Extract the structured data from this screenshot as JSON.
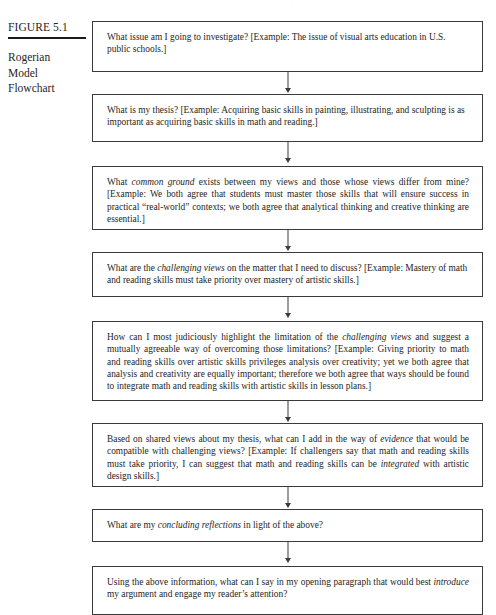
{
  "page": {
    "header_artifact": "· ·"
  },
  "caption": {
    "figure_number": "FIGURE 5.1",
    "title_lines": [
      "Rogerian",
      "Model",
      "Flowchart"
    ]
  },
  "flowchart": {
    "boxes": [
      {
        "id": "box-1",
        "name": "issue-question",
        "align": "left",
        "segments": [
          {
            "text": "What issue am I going to investigate? [Example: The issue of visual arts education in U.S. public schools.]",
            "italic": false
          }
        ]
      },
      {
        "id": "box-2",
        "name": "thesis-question",
        "align": "left",
        "segments": [
          {
            "text": "What is my thesis? [Example: Acquiring basic skills in painting, illustrating, and sculpting is as important as acquiring basic skills in math and reading.]",
            "italic": false
          }
        ]
      },
      {
        "id": "box-3",
        "name": "common-ground-question",
        "align": "justify",
        "segments": [
          {
            "text": "What ",
            "italic": false
          },
          {
            "text": "common ground",
            "italic": true
          },
          {
            "text": " exists between my views and those whose views differ from mine? [Example: We both agree that students must master those skills that will ensure success in practical “real-world” contexts; we both agree that analytical thinking and creative thinking are essential.]",
            "italic": false
          }
        ]
      },
      {
        "id": "box-4",
        "name": "challenging-views-question",
        "align": "left",
        "segments": [
          {
            "text": "What are the ",
            "italic": false
          },
          {
            "text": "challenging views",
            "italic": true
          },
          {
            "text": " on the matter that I need to discuss? [Example: Mastery of math and reading skills must take priority over mastery of artistic skills.]",
            "italic": false
          }
        ]
      },
      {
        "id": "box-5",
        "name": "limitation-highlight-question",
        "align": "justify",
        "segments": [
          {
            "text": "How can I most judiciously highlight the limitation of the ",
            "italic": false
          },
          {
            "text": "challenging views",
            "italic": true
          },
          {
            "text": " and suggest a mutually agreeable way of overcoming those limitations? [Example: Giving priority to math and reading skills over artistic skills privileges analysis over creativity; yet we both agree that analysis and creativity are equally important; therefore we both agree that ways should be found to integrate math and reading skills with artistic skills in lesson plans.]",
            "italic": false
          }
        ]
      },
      {
        "id": "box-6",
        "name": "evidence-question",
        "align": "justify",
        "segments": [
          {
            "text": "Based on shared views about my thesis, what can I add in the way of ",
            "italic": false
          },
          {
            "text": "evidence",
            "italic": true
          },
          {
            "text": " that would be compatible with challenging views? [Example: If challengers say that math and reading skills must take priority, I can suggest that math and reading skills can be ",
            "italic": false
          },
          {
            "text": "integrated",
            "italic": true
          },
          {
            "text": " with artistic design skills.]",
            "italic": false
          }
        ]
      },
      {
        "id": "box-7",
        "name": "concluding-reflections-question",
        "align": "left",
        "segments": [
          {
            "text": "What are my ",
            "italic": false
          },
          {
            "text": "concluding reflections",
            "italic": true
          },
          {
            "text": " in light of the above?",
            "italic": false
          }
        ]
      },
      {
        "id": "box-8",
        "name": "opening-paragraph-question",
        "align": "justify",
        "segments": [
          {
            "text": "Using the above information, what can I say in my opening paragraph that would best ",
            "italic": false
          },
          {
            "text": "introduce",
            "italic": true
          },
          {
            "text": " my argument and engage my reader’s attention?",
            "italic": false
          }
        ]
      }
    ],
    "connector_count": 7,
    "connector_name": "down-arrow-icon",
    "colors": {
      "box_border": "#3b3b3b",
      "text": "#262626",
      "rule": "#1a1a1a",
      "background": "#ffffff"
    }
  }
}
